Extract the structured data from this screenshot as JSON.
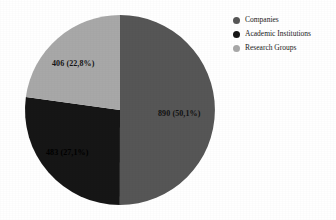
{
  "chart_data": {
    "type": "pie",
    "title": "",
    "subtitle": "",
    "xlabel": "",
    "ylabel": "",
    "legend_position": "top-right",
    "grid": false,
    "decimal_separator": ",",
    "total": 1779,
    "start_angle_deg": 0,
    "direction": "clockwise",
    "categories": [
      "Companies",
      "Academic Institutions",
      "Research Groups"
    ],
    "values": [
      890,
      483,
      406
    ],
    "percentages": [
      50.1,
      27.1,
      22.8
    ],
    "colors": [
      "#565656",
      "#161616",
      "#a8a8a8"
    ],
    "slices": [
      {
        "label": "Companies",
        "value": 890,
        "percent": 50.1,
        "data_label": "890 (50,1%)",
        "color": "#565656"
      },
      {
        "label": "Academic Institutions",
        "value": 483,
        "percent": 27.1,
        "data_label": "483 (27,1%)",
        "color": "#161616"
      },
      {
        "label": "Research Groups",
        "value": 406,
        "percent": 22.8,
        "data_label": "406 (22,8%)",
        "color": "#a8a8a8"
      }
    ]
  },
  "legend": {
    "items": [
      {
        "label": "Companies",
        "color": "#565656",
        "marker": "circle-marker"
      },
      {
        "label": "Academic Institutions",
        "color": "#161616",
        "marker": "circle-marker"
      },
      {
        "label": "Research Groups",
        "color": "#a8a8a8",
        "marker": "circle-marker"
      }
    ]
  },
  "canvas": {
    "background": "#ffffff"
  }
}
